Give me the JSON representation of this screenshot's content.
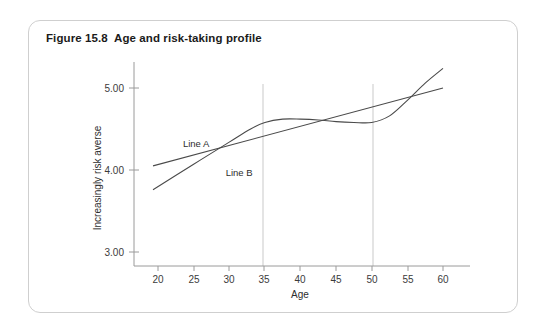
{
  "figure": {
    "title": "Figure 15.8  Age and risk-taking profile"
  },
  "chart_data": {
    "type": "line",
    "title": "Figure 15.8  Age and risk-taking profile",
    "xlabel": "Age",
    "ylabel": "Increasingly risk averse",
    "xlim": [
      18,
      61
    ],
    "ylim": [
      2.75,
      5.35
    ],
    "xticks": [
      20,
      25,
      30,
      35,
      40,
      45,
      50,
      55,
      60
    ],
    "xtick_labels": [
      "20",
      "25",
      "30",
      "35",
      "40",
      "45",
      "50",
      "55",
      "60"
    ],
    "yticks": [
      3.0,
      4.0,
      5.0
    ],
    "ytick_labels": [
      "3.00",
      "4.00",
      "5.00"
    ],
    "grid": "vertical-only",
    "gridlines_x": [
      35,
      50
    ],
    "legend_position": "inline-annotation",
    "annotations": [
      {
        "text": "Line A",
        "x": 23.5,
        "y": 4.28
      },
      {
        "text": "Line B",
        "x": 29.5,
        "y": 3.93
      }
    ],
    "series": [
      {
        "name": "Line A",
        "style": "straight",
        "x": [
          19.3,
          60.0
        ],
        "values": [
          4.05,
          5.0
        ]
      },
      {
        "name": "Line B",
        "style": "s-curve",
        "x": [
          19.3,
          25,
          30,
          33,
          35,
          37.5,
          40,
          42.5,
          45,
          47.5,
          50,
          52.5,
          55,
          57.5,
          60
        ],
        "values": [
          3.76,
          4.07,
          4.34,
          4.5,
          4.58,
          4.62,
          4.62,
          4.61,
          4.59,
          4.58,
          4.58,
          4.66,
          4.85,
          5.06,
          5.24
        ]
      }
    ]
  },
  "colors": {
    "card_border": "#cfcfcf",
    "axis": "#9a9a9a",
    "gridline": "#c9c9c9",
    "line": "#4a4a4a",
    "text": "#2e2e2e",
    "background": "#ffffff"
  }
}
